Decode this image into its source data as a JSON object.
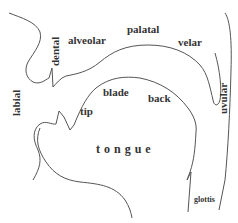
{
  "diagram": {
    "stroke_color": "#555555",
    "text_color": "#333333",
    "labels": {
      "labial": "labial",
      "dental": "dental",
      "alveolar": "alveolar",
      "palatal": "palatal",
      "velar": "velar",
      "uvular": "uvular",
      "tip": "tip",
      "blade": "blade",
      "back": "back",
      "tongue": "tongue",
      "glottis": "glottis"
    }
  }
}
